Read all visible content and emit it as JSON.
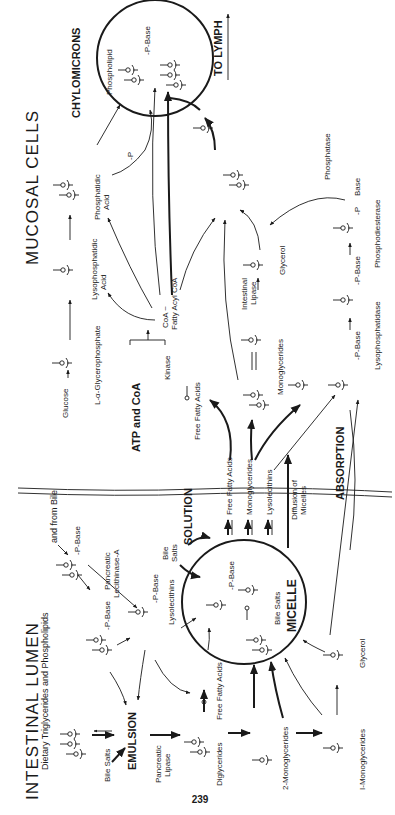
{
  "page": {
    "page_number": "239",
    "orientation": "rotated-90-ccw"
  },
  "regions": {
    "lumen_title": "INTESTINAL   LUMEN",
    "mucosal_title": "MUCOSAL   CELLS"
  },
  "states": {
    "emulsion": "EMULSION",
    "solution": "SOLUTION",
    "micelle": "MICELLE",
    "absorption": "ABSORPTION",
    "chylomicrons": "CHYLOMICRONS",
    "to_lymph": "TO LYMPH",
    "atp_coa": "ATP and CoA"
  },
  "lumen_labels": {
    "dietary": "Dietary Triglycerides and Phospholipids",
    "from_bile": "and from Bile",
    "bile_salts_1": "Bile Salts",
    "pancreatic_lipase_1": "Pancreatic",
    "pancreatic_lipase_2": "Lipase",
    "pancreatic_lec_1": "Pancreatic",
    "pancreatic_lec_2": "Lecithinase-A",
    "p_base_1": "-P-Base",
    "p_base_2": "-P-Base",
    "p_base_3": "-P-Base",
    "lysolecithins": "Lysolecithins",
    "bile_salts_2a": "Bile",
    "bile_salts_2b": "Salts",
    "free_fatty_acids": "Free Fatty Acids",
    "diglycerides": "Diglycerides",
    "two_mono": "2-Monoglycerides",
    "one_mono": "I-Monoglycerides",
    "glycerol": "Glycerol",
    "micelle_p_base": "-P-Base",
    "micelle_bile_salts": "Bile Salts"
  },
  "solution_labels": {
    "ffa": "Free Fatty Acids",
    "mono": "Monoglycerides",
    "lyso": "Lysolecithins",
    "diffusion_1": "Diffusion of",
    "diffusion_2": "Micelles"
  },
  "mucosal_labels": {
    "glucose": "Glucose",
    "glycerophosphate": "L-α-Glycerophosphate",
    "lysophosphatidic_1": "Lysophosphatidic",
    "lysophosphatidic_2": "Acid",
    "phosphatidic_1": "Phosphatidic",
    "phosphatidic_2": "Acid",
    "minus_p": "-P",
    "phospholipid": "Phospholipid",
    "chylo_p_base": "-P-Base",
    "kinase": "Kinase",
    "coa_1": "CoA ~",
    "coa_2": "Fatty Acyl CoA",
    "free_fatty_acids": "Free Fatty Acids",
    "monoglycerides": "Monoglycerides",
    "intestinal_1": "Intestinal",
    "intestinal_2": "Lipase",
    "glycerol": "Glycerol",
    "phosphatase": "Phosphatase",
    "p_base_lyso": "-P-Base",
    "lysophosphatidase": "Lysophosphatidase",
    "p_base_pd": "-P",
    "base": "Base",
    "phosphodiesterase": "Phosphodiesterase",
    "p1": "-P",
    "p2": "-P"
  }
}
